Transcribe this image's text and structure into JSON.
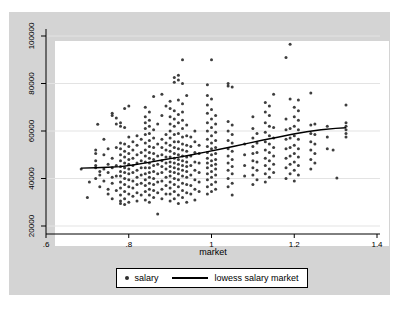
{
  "figure": {
    "page_bg": "#ffffff",
    "chart_bg": "#d4d4d4",
    "plot_bg": "#ffffff",
    "grid_color": "#e3e3e3",
    "axis_color": "#000000",
    "dot_color": "#2e2e2e",
    "lowess_color": "#000000"
  },
  "chart_data": {
    "type": "scatter",
    "title": "",
    "xlabel": "market",
    "ylabel": "",
    "x_ticks": [
      ".6",
      ".8",
      "1",
      "1.2",
      "1.4"
    ],
    "x_tick_values": [
      0.6,
      0.8,
      1.0,
      1.2,
      1.4
    ],
    "y_ticks": [
      "20000",
      "40000",
      "60000",
      "80000",
      "100000"
    ],
    "y_tick_values": [
      20000,
      40000,
      60000,
      80000,
      100000
    ],
    "xlim": [
      0.6,
      1.407
    ],
    "ylim": [
      16600,
      103000
    ],
    "grid": "horizontal",
    "legend": {
      "position": "bottom",
      "entries": [
        "salary",
        "lowess salary market"
      ]
    },
    "series": [
      {
        "name": "salary",
        "type": "scatter",
        "scatter_columns": [
          {
            "m": 0.685,
            "s": [
              44000
            ]
          },
          {
            "m": 0.7,
            "s": [
              32000
            ]
          },
          {
            "m": 0.705,
            "s": [
              38500
            ]
          },
          {
            "m": 0.72,
            "s": [
              40000,
              44500,
              45500,
              47500,
              50500,
              52000
            ]
          },
          {
            "m": 0.725,
            "s": [
              62800
            ]
          },
          {
            "m": 0.73,
            "s": [
              36500,
              41500,
              43000
            ]
          },
          {
            "m": 0.74,
            "s": [
              39000,
              44000,
              50000,
              56500
            ]
          },
          {
            "m": 0.75,
            "s": [
              33500,
              35500,
              42500,
              46000,
              52500
            ]
          },
          {
            "m": 0.76,
            "s": [
              31500,
              38000,
              40500,
              44500,
              48500,
              66500,
              67500
            ]
          },
          {
            "m": 0.77,
            "s": [
              35000,
              41000,
              45500,
              53000,
              63000,
              65500
            ]
          },
          {
            "m": 0.78,
            "s": [
              29500,
              30500,
              33000,
              36000,
              38500,
              41000,
              43000,
              45000,
              47500,
              50000,
              52500,
              55000,
              62000,
              63500
            ]
          },
          {
            "m": 0.79,
            "s": [
              29000,
              31500,
              34500,
              37500,
              40000,
              42500,
              44500,
              46500,
              49000,
              51500,
              54500,
              61500,
              69500
            ]
          },
          {
            "m": 0.8,
            "s": [
              30000,
              33500,
              36500,
              39500,
              42000,
              44000,
              46000,
              48000,
              50500,
              53500,
              57500,
              70500
            ]
          },
          {
            "m": 0.81,
            "s": [
              32500,
              36000,
              39000,
              42500,
              45500,
              48500,
              52000,
              55500
            ]
          },
          {
            "m": 0.82,
            "s": [
              30500,
              34000,
              37500,
              40500,
              43500,
              46500,
              50000,
              54000,
              58000
            ]
          },
          {
            "m": 0.83,
            "s": [
              33000,
              38000,
              41500,
              44500,
              47500,
              51000,
              56500
            ]
          },
          {
            "m": 0.84,
            "s": [
              31000,
              34500,
              37000,
              39500,
              42000,
              44500,
              47000,
              49500,
              52000,
              55000,
              58500,
              61000,
              63500,
              66000,
              70000
            ]
          },
          {
            "m": 0.85,
            "s": [
              30000,
              33000,
              35500,
              38000,
              40500,
              42500,
              44500,
              46500,
              48500,
              51000,
              53500,
              56000,
              59000,
              62000,
              64500,
              68000
            ]
          },
          {
            "m": 0.86,
            "s": [
              32000,
              35000,
              37500,
              40000,
              43000,
              45500,
              48000,
              50500,
              53000,
              57000,
              60500,
              74500
            ]
          },
          {
            "m": 0.87,
            "s": [
              25000,
              34000,
              38500,
              42000,
              46000,
              49500,
              54500,
              63000
            ]
          },
          {
            "m": 0.88,
            "s": [
              31500,
              35500,
              39000,
              42500,
              45000,
              47500,
              50000,
              53000,
              56500,
              66500,
              75500
            ]
          },
          {
            "m": 0.89,
            "s": [
              33500,
              37000,
              40500,
              44000,
              46500,
              49000,
              52000,
              55000,
              58500,
              70500
            ]
          },
          {
            "m": 0.9,
            "s": [
              30500,
              33500,
              36000,
              38500,
              41000,
              43000,
              45000,
              47000,
              49000,
              51500,
              54000,
              57000,
              60000,
              63000,
              66000,
              69500,
              72500
            ]
          },
          {
            "m": 0.91,
            "s": [
              31500,
              34500,
              37500,
              40000,
              42500,
              44500,
              46500,
              48500,
              50500,
              53000,
              55500,
              58500,
              62000,
              65000,
              68500,
              80500,
              82500
            ]
          },
          {
            "m": 0.92,
            "s": [
              29500,
              33000,
              36500,
              39500,
              42000,
              44000,
              46000,
              48000,
              50000,
              52500,
              55500,
              59000,
              63500,
              67000,
              73000,
              81500,
              83500
            ]
          },
          {
            "m": 0.93,
            "s": [
              32000,
              35000,
              38000,
              41000,
              43500,
              45500,
              47500,
              49500,
              52000,
              54500,
              57500,
              61000,
              64500,
              68000,
              71500,
              80000,
              90000
            ]
          },
          {
            "m": 0.94,
            "s": [
              30000,
              34000,
              37500,
              40500,
              43000,
              45000,
              47000,
              49000,
              51500,
              54000,
              58000,
              62500,
              75000
            ]
          },
          {
            "m": 0.95,
            "s": [
              33500,
              37000,
              41500,
              45500,
              49500,
              53500,
              57500
            ]
          },
          {
            "m": 0.96,
            "s": [
              31000,
              35500,
              39500,
              43500,
              47000,
              51000,
              55500,
              60000
            ]
          },
          {
            "m": 0.97,
            "s": [
              34500,
              38500,
              42500,
              46500,
              50500,
              54000
            ]
          },
          {
            "m": 0.99,
            "s": [
              33500,
              36500,
              39500,
              42000,
              44500,
              46500,
              48500,
              51000,
              53500,
              56500,
              60000,
              63500,
              67500,
              71000,
              75000,
              79500
            ]
          },
          {
            "m": 1.0,
            "s": [
              34500,
              37500,
              40500,
              43000,
              45500,
              47500,
              50000,
              52500,
              55000,
              58000,
              61500,
              65000,
              69000,
              73500,
              90000
            ]
          },
          {
            "m": 1.01,
            "s": [
              35500,
              38500,
              41500,
              44000,
              46000,
              48000,
              50500,
              53000,
              56000,
              59500,
              63000,
              66500
            ]
          },
          {
            "m": 1.04,
            "s": [
              36500,
              40000,
              43500,
              46500,
              49500,
              52500,
              56000,
              60000,
              64000,
              79000,
              80000
            ]
          },
          {
            "m": 1.05,
            "s": [
              33000,
              38000,
              42000,
              45000,
              48000,
              51500,
              55000,
              58500,
              62500,
              78500
            ]
          },
          {
            "m": 1.08,
            "s": [
              41000,
              45500,
              50000,
              54500
            ]
          },
          {
            "m": 1.1,
            "s": [
              37500,
              41500,
              44500,
              47500,
              50500,
              53500,
              57000,
              61000,
              66000
            ]
          },
          {
            "m": 1.11,
            "s": [
              39500,
              43500,
              47000,
              51000,
              55000,
              59000
            ]
          },
          {
            "m": 1.13,
            "s": [
              38500,
              42000,
              45500,
              48500,
              52000,
              55500,
              59500,
              63500,
              68000,
              72000
            ]
          },
          {
            "m": 1.14,
            "s": [
              40500,
              44000,
              47500,
              51000,
              54500,
              58000,
              62000,
              66500,
              70500
            ]
          },
          {
            "m": 1.15,
            "s": [
              42500,
              46000,
              49500,
              53000,
              57000,
              61500,
              75500
            ]
          },
          {
            "m": 1.18,
            "s": [
              40000,
              44500,
              48500,
              52500,
              56500,
              60500,
              65000,
              91000
            ]
          },
          {
            "m": 1.19,
            "s": [
              42000,
              46000,
              49500,
              53000,
              57000,
              61000,
              73500,
              96500
            ]
          },
          {
            "m": 1.2,
            "s": [
              39000,
              43500,
              47000,
              50500,
              54000,
              58000,
              62000,
              66000,
              70000
            ]
          },
          {
            "m": 1.21,
            "s": [
              41500,
              45500,
              49000,
              52500,
              56500,
              60500,
              64500,
              68500,
              73000
            ]
          },
          {
            "m": 1.24,
            "s": [
              44000,
              48000,
              52000,
              55500,
              59000,
              62500,
              76000
            ]
          },
          {
            "m": 1.25,
            "s": [
              46500,
              50500,
              54500,
              58500,
              63000
            ]
          },
          {
            "m": 1.28,
            "s": [
              52500,
              57500,
              62000
            ]
          },
          {
            "m": 1.294,
            "s": [
              52000
            ]
          },
          {
            "m": 1.303,
            "s": [
              40200
            ]
          },
          {
            "m": 1.325,
            "s": [
              57500,
              59000,
              60500,
              62000,
              63500,
              71000
            ]
          }
        ]
      },
      {
        "name": "lowess salary market",
        "type": "line",
        "points": [
          [
            0.685,
            44400
          ],
          [
            0.72,
            44500
          ],
          [
            0.75,
            44700
          ],
          [
            0.78,
            45000
          ],
          [
            0.81,
            45700
          ],
          [
            0.845,
            46700
          ],
          [
            0.88,
            47800
          ],
          [
            0.915,
            48800
          ],
          [
            0.95,
            49900
          ],
          [
            0.985,
            51100
          ],
          [
            1.02,
            52300
          ],
          [
            1.055,
            53600
          ],
          [
            1.09,
            54900
          ],
          [
            1.125,
            56200
          ],
          [
            1.16,
            57400
          ],
          [
            1.195,
            58600
          ],
          [
            1.23,
            59700
          ],
          [
            1.265,
            60500
          ],
          [
            1.3,
            61100
          ],
          [
            1.325,
            61400
          ]
        ]
      }
    ]
  }
}
